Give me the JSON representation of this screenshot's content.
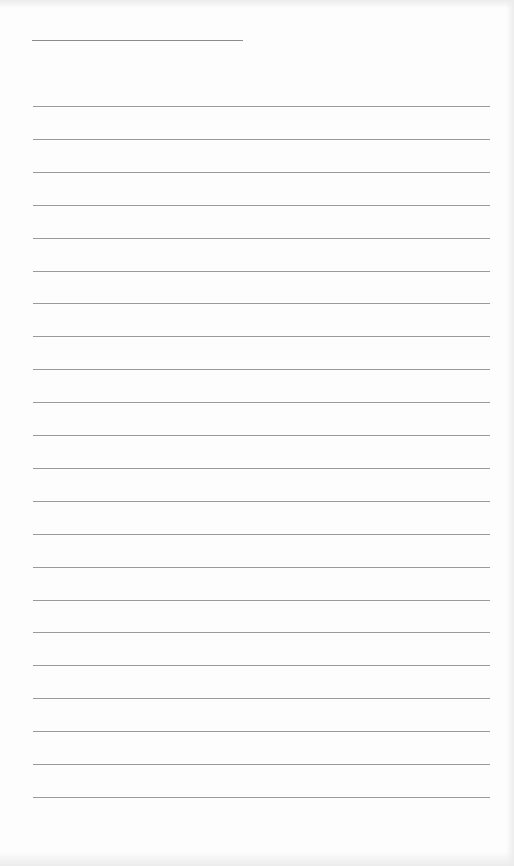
{
  "page": {
    "type": "lined-paper",
    "header_line": {
      "x": 32,
      "y": 40,
      "width": 211,
      "color": "#8c8c8c"
    },
    "ruled_lines": {
      "count": 22,
      "x": 33,
      "width": 457,
      "first_y": 106,
      "spacing": 32.9,
      "color": "#9a9a9a"
    },
    "background_color": "#fdfdfd",
    "text": []
  }
}
